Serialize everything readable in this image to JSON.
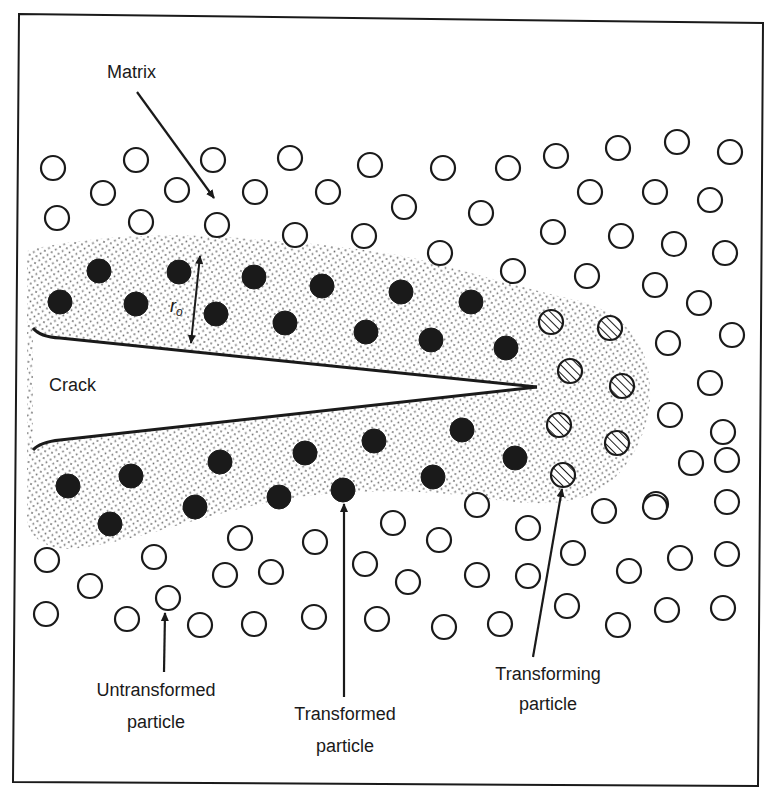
{
  "figure": {
    "colors": {
      "ink": "#1a1a1a",
      "background": "#ffffff",
      "stipple": "#6a6a6a"
    },
    "labels": {
      "matrix": "Matrix",
      "crack": "Crack",
      "r0": "r",
      "r0_sub": "o",
      "untransformed_l1": "Untransformed",
      "untransformed_l2": "particle",
      "transformed_l1": "Transformed",
      "transformed_l2": "particle",
      "transforming_l1": "Transforming",
      "transforming_l2": "particle"
    },
    "particle_radius": 12,
    "untransformed_particles": [
      [
        53,
        168
      ],
      [
        136,
        160
      ],
      [
        213,
        160
      ],
      [
        290,
        158
      ],
      [
        370,
        165
      ],
      [
        103,
        193
      ],
      [
        177,
        190
      ],
      [
        255,
        192
      ],
      [
        328,
        192
      ],
      [
        57,
        218
      ],
      [
        141,
        222
      ],
      [
        217,
        225
      ],
      [
        295,
        235
      ],
      [
        364,
        236
      ],
      [
        443,
        168
      ],
      [
        508,
        168
      ],
      [
        556,
        156
      ],
      [
        618,
        148
      ],
      [
        404,
        207
      ],
      [
        481,
        213
      ],
      [
        590,
        192
      ],
      [
        440,
        253
      ],
      [
        553,
        232
      ],
      [
        621,
        236
      ],
      [
        513,
        271
      ],
      [
        587,
        276
      ],
      [
        677,
        142
      ],
      [
        730,
        152
      ],
      [
        655,
        192
      ],
      [
        710,
        200
      ],
      [
        674,
        244
      ],
      [
        725,
        253
      ],
      [
        655,
        285
      ],
      [
        699,
        303
      ],
      [
        668,
        343
      ],
      [
        732,
        335
      ],
      [
        710,
        383
      ],
      [
        670,
        415
      ],
      [
        723,
        432
      ],
      [
        691,
        463
      ],
      [
        656,
        504
      ],
      [
        727,
        460
      ],
      [
        47,
        560
      ],
      [
        90,
        586
      ],
      [
        154,
        557
      ],
      [
        168,
        598
      ],
      [
        240,
        538
      ],
      [
        225,
        575
      ],
      [
        271,
        572
      ],
      [
        315,
        542
      ],
      [
        46,
        614
      ],
      [
        127,
        619
      ],
      [
        200,
        625
      ],
      [
        254,
        624
      ],
      [
        314,
        617
      ],
      [
        393,
        523
      ],
      [
        439,
        540
      ],
      [
        477,
        505
      ],
      [
        528,
        528
      ],
      [
        604,
        511
      ],
      [
        655,
        507
      ],
      [
        727,
        502
      ],
      [
        365,
        564
      ],
      [
        408,
        582
      ],
      [
        477,
        575
      ],
      [
        528,
        576
      ],
      [
        573,
        553
      ],
      [
        629,
        571
      ],
      [
        680,
        558
      ],
      [
        727,
        554
      ],
      [
        377,
        619
      ],
      [
        444,
        627
      ],
      [
        500,
        624
      ],
      [
        567,
        606
      ],
      [
        618,
        625
      ],
      [
        667,
        610
      ],
      [
        723,
        608
      ]
    ],
    "transformed_particles": [
      [
        99,
        271
      ],
      [
        179,
        272
      ],
      [
        254,
        277
      ],
      [
        322,
        286
      ],
      [
        401,
        292
      ],
      [
        471,
        302
      ],
      [
        60,
        302
      ],
      [
        136,
        304
      ],
      [
        216,
        314
      ],
      [
        285,
        323
      ],
      [
        366,
        332
      ],
      [
        431,
        340
      ],
      [
        506,
        348
      ],
      [
        68,
        486
      ],
      [
        131,
        476
      ],
      [
        220,
        462
      ],
      [
        305,
        453
      ],
      [
        374,
        441
      ],
      [
        462,
        430
      ],
      [
        515,
        458
      ],
      [
        110,
        524
      ],
      [
        195,
        507
      ],
      [
        279,
        497
      ],
      [
        343,
        490
      ],
      [
        433,
        477
      ]
    ],
    "transforming_particles": [
      [
        551,
        322
      ],
      [
        610,
        328
      ],
      [
        570,
        371
      ],
      [
        622,
        386
      ],
      [
        559,
        425
      ],
      [
        617,
        443
      ],
      [
        563,
        475
      ]
    ]
  }
}
